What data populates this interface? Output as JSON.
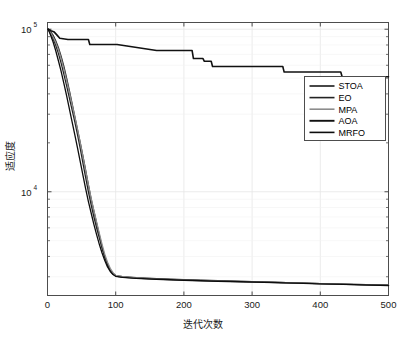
{
  "chart_data": {
    "type": "line",
    "title": "",
    "xlabel": "迭代次数",
    "ylabel": "适应度",
    "xlim": [
      0,
      500
    ],
    "ylim": [
      2300,
      110000
    ],
    "yscale": "log",
    "xticks": [
      0,
      100,
      200,
      300,
      400,
      500
    ],
    "xticklabels": [
      "0",
      "100",
      "200",
      "300",
      "400",
      "500"
    ],
    "yticks": [
      10000,
      100000
    ],
    "yticklabels": [
      "10⁴",
      "10⁵"
    ],
    "grid": true,
    "legend_position": "center-right",
    "series": [
      {
        "name": "STOA",
        "color": "#1a1a1a",
        "width": 1.3,
        "x": [
          1,
          4,
          8,
          12,
          16,
          20,
          24,
          28,
          32,
          36,
          40,
          44,
          48,
          52,
          56,
          60,
          64,
          68,
          72,
          76,
          80,
          84,
          88,
          92,
          96,
          100,
          110,
          130,
          160,
          200,
          250,
          300,
          350,
          400,
          450,
          500
        ],
        "values": [
          100000,
          97000,
          92000,
          85000,
          77000,
          68000,
          59000,
          50000,
          42000,
          35000,
          29000,
          24000,
          20000,
          16500,
          13500,
          11000,
          9000,
          7600,
          6400,
          5400,
          4600,
          4000,
          3600,
          3300,
          3150,
          3050,
          3000,
          2960,
          2920,
          2880,
          2840,
          2800,
          2760,
          2720,
          2690,
          2660
        ]
      },
      {
        "name": "EO",
        "color": "#232323",
        "width": 1.3,
        "x": [
          1,
          4,
          8,
          12,
          16,
          20,
          24,
          28,
          32,
          36,
          40,
          44,
          48,
          52,
          56,
          60,
          64,
          68,
          72,
          76,
          80,
          84,
          88,
          92,
          96,
          100,
          110,
          130,
          160,
          200,
          250,
          300,
          350,
          400,
          450,
          500
        ],
        "values": [
          100000,
          95000,
          88000,
          80000,
          71000,
          62000,
          53000,
          45000,
          38000,
          32000,
          27000,
          22500,
          18500,
          15000,
          12200,
          10000,
          8300,
          7000,
          6000,
          5200,
          4500,
          3950,
          3550,
          3280,
          3120,
          3030,
          2980,
          2940,
          2900,
          2860,
          2820,
          2790,
          2755,
          2720,
          2685,
          2655
        ]
      },
      {
        "name": "MPA",
        "color": "#8c8c8c",
        "width": 1.3,
        "x": [
          1,
          4,
          8,
          12,
          16,
          20,
          24,
          28,
          32,
          36,
          40,
          44,
          48,
          52,
          56,
          60,
          64,
          68,
          72,
          76,
          80,
          84,
          88,
          92,
          96,
          100,
          110,
          130,
          160,
          200,
          250,
          300,
          350,
          400,
          450,
          500
        ],
        "values": [
          100000,
          96000,
          90000,
          83000,
          75000,
          66000,
          57000,
          48500,
          41000,
          34500,
          29000,
          24200,
          20000,
          16400,
          13400,
          11000,
          9100,
          7650,
          6500,
          5550,
          4750,
          4120,
          3680,
          3380,
          3180,
          3060,
          3000,
          2955,
          2910,
          2870,
          2830,
          2795,
          2760,
          2725,
          2695,
          2665
        ]
      },
      {
        "name": "AOA",
        "color": "#111111",
        "width": 1.6,
        "x": [
          1,
          5,
          10,
          14,
          18,
          30,
          45,
          60,
          62,
          100,
          102,
          160,
          162,
          212,
          214,
          228,
          230,
          240,
          242,
          300,
          302,
          345,
          347,
          430,
          432,
          500
        ],
        "values": [
          100000,
          98000,
          96000,
          92000,
          88000,
          86500,
          86500,
          86500,
          80500,
          80500,
          80500,
          74000,
          74000,
          74000,
          66000,
          66000,
          63500,
          63500,
          59000,
          59000,
          59000,
          59000,
          54500,
          54500,
          51000,
          51000
        ]
      },
      {
        "name": "MRFO",
        "color": "#0d0d0d",
        "width": 1.3,
        "x": [
          1,
          4,
          8,
          12,
          16,
          20,
          24,
          28,
          32,
          36,
          40,
          44,
          48,
          52,
          56,
          60,
          64,
          68,
          72,
          76,
          80,
          84,
          88,
          92,
          96,
          100,
          110,
          130,
          160,
          200,
          250,
          300,
          350,
          400,
          450,
          500
        ],
        "values": [
          100000,
          93000,
          84000,
          74000,
          64000,
          55000,
          46500,
          39000,
          32500,
          27000,
          22500,
          18600,
          15300,
          12600,
          10400,
          8700,
          7400,
          6300,
          5450,
          4750,
          4200,
          3780,
          3450,
          3230,
          3100,
          3020,
          2975,
          2935,
          2895,
          2855,
          2815,
          2785,
          2750,
          2715,
          2680,
          2650
        ]
      }
    ]
  },
  "legend": {
    "items": [
      {
        "label": "STOA"
      },
      {
        "label": "EO"
      },
      {
        "label": "MPA"
      },
      {
        "label": "AOA"
      },
      {
        "label": "MRFO"
      }
    ]
  }
}
